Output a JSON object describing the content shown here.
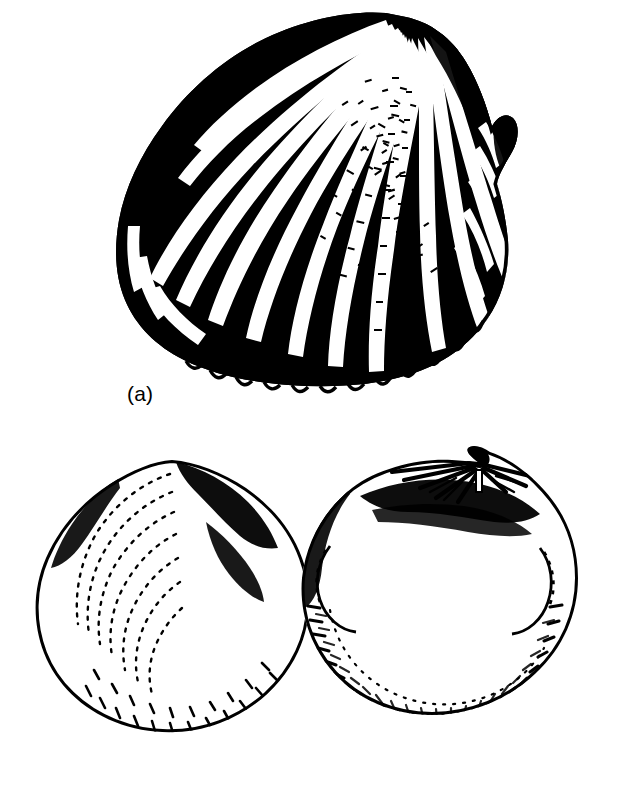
{
  "figure": {
    "background_color": "#ffffff",
    "ink_color": "#000000",
    "width": 625,
    "height": 791,
    "style": "black and white line drawing with stipple and hatching"
  },
  "panels": [
    {
      "id": "a",
      "label": "(a)",
      "label_position": {
        "x": 127,
        "y": 383
      },
      "subject": "ribbed bivalve shell, exterior view",
      "description": "Obliquely oval shell with approximately 25 strong radiating ribs diverging from an umbo near the upper right; beaded ornament along ribs; dark shaded posterior auricle at right; crenulated ventral margin",
      "bounds": {
        "x": 115,
        "y": 15,
        "width": 405,
        "height": 370
      },
      "rib_count": 25,
      "umbo_position": {
        "x": 400,
        "y": 30
      }
    },
    {
      "id": "b",
      "label": "(b)",
      "label_position": {
        "x": 29,
        "y": 740
      },
      "subject": "pair of rounded bivalve valves",
      "description": "Two sub-circular valves side by side; left valve exterior with stippled shading and fine concentric growth lines; right valve interior showing hinge plate with teeth, muscle scars and crenulated inner margin",
      "bounds": {
        "x": 30,
        "y": 455,
        "width": 580,
        "height": 310
      },
      "valves": [
        {
          "id": "b-left",
          "view": "exterior",
          "description": "Sub-circular valve with pointed umbo at top, heavy stipple, concentric growth lines on anterior half, dark shading along posterior slope",
          "bounds": {
            "x": 35,
            "y": 460,
            "width": 275,
            "height": 295
          }
        },
        {
          "id": "b-right",
          "view": "interior",
          "description": "Sub-circular valve showing hinge plate with radiating teeth below the beak, dark shading beneath the hinge, two muscle scars, dense stipple and finely crenulated inner margin",
          "bounds": {
            "x": 345,
            "y": 465,
            "width": 260,
            "height": 295
          }
        }
      ]
    }
  ]
}
